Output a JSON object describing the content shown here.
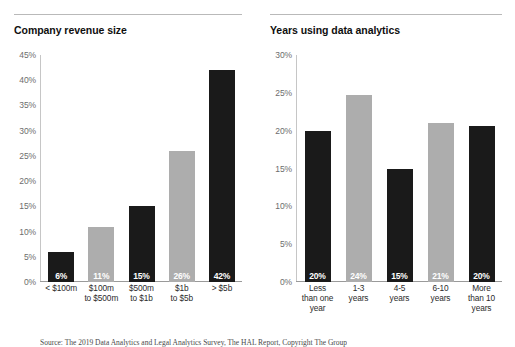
{
  "footnote": "Source: The 2019 Data Analytics and Legal Analytics Survey, The HAL Report, Copyright The Group",
  "chart_data": [
    {
      "type": "bar",
      "title": "Company revenue size",
      "xlabel": "",
      "ylabel": "",
      "ylim": [
        0,
        45
      ],
      "grid": false,
      "legend": "none",
      "ytick_labels": [
        "45%",
        "40%",
        "35%",
        "30%",
        "25%",
        "20%",
        "15%",
        "10%",
        "5%",
        "0%"
      ],
      "yticks": [
        45,
        40,
        35,
        30,
        25,
        20,
        15,
        10,
        5,
        0
      ],
      "categories": [
        "< $100m",
        "$100m\nto $500m",
        "$500m\nto $1b",
        "$1b\nto $5b",
        "> $5b"
      ],
      "category_lines": [
        [
          "< $100m"
        ],
        [
          "$100m",
          "to $500m"
        ],
        [
          "$500m",
          "to $1b"
        ],
        [
          "$1b",
          "to $5b"
        ],
        [
          "> $5b"
        ]
      ],
      "values": [
        6,
        11,
        15,
        26,
        42
      ],
      "data_labels": [
        "6%",
        "11%",
        "15%",
        "26%",
        "42%"
      ],
      "bar_colors": [
        "#1a1a1a",
        "#adadad",
        "#1a1a1a",
        "#adadad",
        "#1a1a1a"
      ]
    },
    {
      "type": "bar",
      "title": "Years using data analytics",
      "xlabel": "",
      "ylabel": "",
      "ylim": [
        0,
        30
      ],
      "grid": false,
      "legend": "none",
      "ytick_labels": [
        "30%",
        "25%",
        "20%",
        "15%",
        "10%",
        "5%",
        "0%"
      ],
      "yticks": [
        30,
        25,
        20,
        15,
        10,
        5,
        0
      ],
      "categories": [
        "Less than one year",
        "1-3 years",
        "4-5 years",
        "6-10 years",
        "More than 10 years"
      ],
      "category_lines": [
        [
          "Less",
          "than one",
          "year"
        ],
        [
          "1-3",
          "years"
        ],
        [
          "4-5",
          "years"
        ],
        [
          "6-10",
          "years"
        ],
        [
          "More",
          "than 10",
          "years"
        ]
      ],
      "values": [
        20,
        24.7,
        15,
        21,
        20.6
      ],
      "data_labels": [
        "20%",
        "24%",
        "15%",
        "21%",
        "20%"
      ],
      "bar_colors": [
        "#1a1a1a",
        "#adadad",
        "#1a1a1a",
        "#adadad",
        "#1a1a1a"
      ]
    }
  ]
}
